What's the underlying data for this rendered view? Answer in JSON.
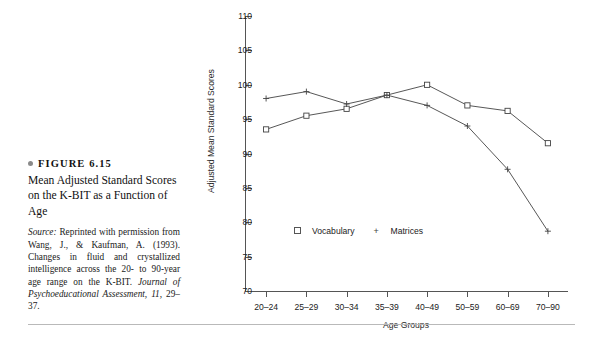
{
  "figure": {
    "label": "FIGURE 6.15",
    "bullet_icon": "bullet-dot-icon",
    "title": "Mean Adjusted Standard Scores on the K-BIT as a Function of Age",
    "source_label": "Source:",
    "source_text": "Reprinted with permission from Wang, J., & Kaufman, A. (1993). Changes in fluid and crystallized intelligence across the 20- to 90-year age range on the K-BIT.",
    "source_journal": "Journal of Psychoeducational Assessment,",
    "source_volume": "11,",
    "source_pages": "29–37."
  },
  "chart_data": {
    "type": "line",
    "title": "",
    "xlabel": "Age Groups",
    "ylabel": "Adjusted Mean Standard Scores",
    "categories": [
      "20–24",
      "25–29",
      "30–34",
      "35–39",
      "40–49",
      "50–59",
      "60–69",
      "70–90"
    ],
    "ylim": [
      70,
      110
    ],
    "yticks": [
      70,
      75,
      80,
      85,
      90,
      95,
      100,
      105,
      110
    ],
    "grid": false,
    "legend_position": "inside-bottom-left",
    "series": [
      {
        "name": "Vocabulary",
        "marker": "open-square",
        "values": [
          93.5,
          95.5,
          96.5,
          98.5,
          100.0,
          97.0,
          96.2,
          91.5
        ]
      },
      {
        "name": "Matrices",
        "marker": "plus",
        "values": [
          98.0,
          99.0,
          97.2,
          98.5,
          97.0,
          94.0,
          87.7,
          78.7
        ]
      }
    ]
  }
}
